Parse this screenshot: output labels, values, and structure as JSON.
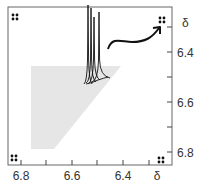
{
  "figure": {
    "type": "2D NMR spectrum schematic",
    "x_axis": {
      "ticks": [
        {
          "label": "6.8",
          "x": 21
        },
        {
          "label": "",
          "x": 46
        },
        {
          "label": "6.6",
          "x": 72
        },
        {
          "label": "",
          "x": 97
        },
        {
          "label": "6.4",
          "x": 123
        },
        {
          "label": "",
          "x": 149
        }
      ],
      "unit_label": "δ"
    },
    "y_axis": {
      "ticks": [
        {
          "label": "",
          "y": 27
        },
        {
          "label": "6.4",
          "y": 52
        },
        {
          "label": "",
          "y": 77
        },
        {
          "label": "6.6",
          "y": 102
        },
        {
          "label": "",
          "y": 127
        },
        {
          "label": "6.8",
          "y": 152
        }
      ],
      "unit_label": "δ"
    },
    "corner_symbols": [
      "four-dot",
      "four-dot",
      "four-dot",
      "four-dot"
    ],
    "shaded_region": "gray triangular region lower-left",
    "arrow": "curved arrow from peaks to top-right corner symbol",
    "colors": {
      "frame": "#555555",
      "shade": "#e6e6e6",
      "ink": "#111111"
    }
  }
}
